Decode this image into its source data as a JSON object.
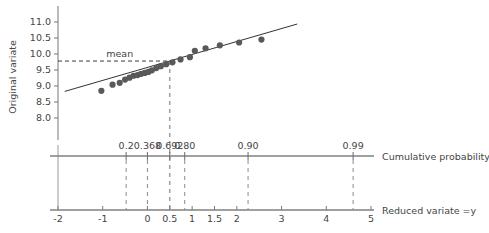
{
  "chart_data": {
    "type": "scatter",
    "title": "",
    "subtitle": "",
    "ylabel": "Original variate",
    "xlabel": "Reduced variate =y",
    "secondary_axis_label": "Cumulative probability",
    "grid": false,
    "legend": "none",
    "xlim": [
      -2,
      5
    ],
    "ylim": [
      7.75,
      11.25
    ],
    "y_ticks": [
      "8.0",
      "8.5",
      "9.0",
      "9.5",
      "10.0",
      "10.5",
      "11.0"
    ],
    "y_tick_values": [
      8.0,
      8.5,
      9.0,
      9.5,
      10.0,
      10.5,
      11.0
    ],
    "x_ticks": [
      "-2",
      "-1",
      "0",
      "0.5",
      "1",
      "1.5",
      "2",
      "3",
      "4",
      "5"
    ],
    "x_tick_values": [
      -2,
      -1,
      0,
      0.5,
      1,
      1.5,
      2,
      3,
      4,
      5
    ],
    "cumulative_probability_ticks": [
      "0.2",
      "0.368",
      "0.692",
      "0.80",
      "0.90",
      "0.99"
    ],
    "cumulative_probability_values": [
      0.2,
      0.368,
      0.692,
      0.8,
      0.9,
      0.99
    ],
    "cumulative_probability_y": [
      -0.4759,
      0.0,
      0.5,
      0.834,
      2.2504,
      4.6001
    ],
    "mean_label": "mean",
    "mean_value": 9.78,
    "mean_reduced_variate": 0.5,
    "fit_line": {
      "slope": 0.405,
      "intercept": 9.58,
      "x_from": -1.85,
      "x_to": 3.35
    },
    "series": [
      {
        "name": "observations",
        "color": "#595959",
        "x": [
          -1.03,
          -0.78,
          -0.62,
          -0.5,
          -0.4,
          -0.31,
          -0.22,
          -0.14,
          -0.06,
          0.02,
          0.1,
          0.2,
          0.3,
          0.42,
          0.56,
          0.74,
          0.95,
          1.06,
          1.3,
          1.62,
          2.05,
          2.55
        ],
        "y": [
          8.85,
          9.04,
          9.1,
          9.2,
          9.26,
          9.32,
          9.34,
          9.38,
          9.41,
          9.44,
          9.49,
          9.56,
          9.62,
          9.68,
          9.74,
          9.83,
          9.9,
          10.1,
          10.18,
          10.27,
          10.36,
          10.45
        ]
      }
    ]
  },
  "axes": {
    "y_axis_title": "Original variate",
    "bottom_axis_title": "Reduced variate =y",
    "probability_axis_title": "Cumulative probability"
  }
}
